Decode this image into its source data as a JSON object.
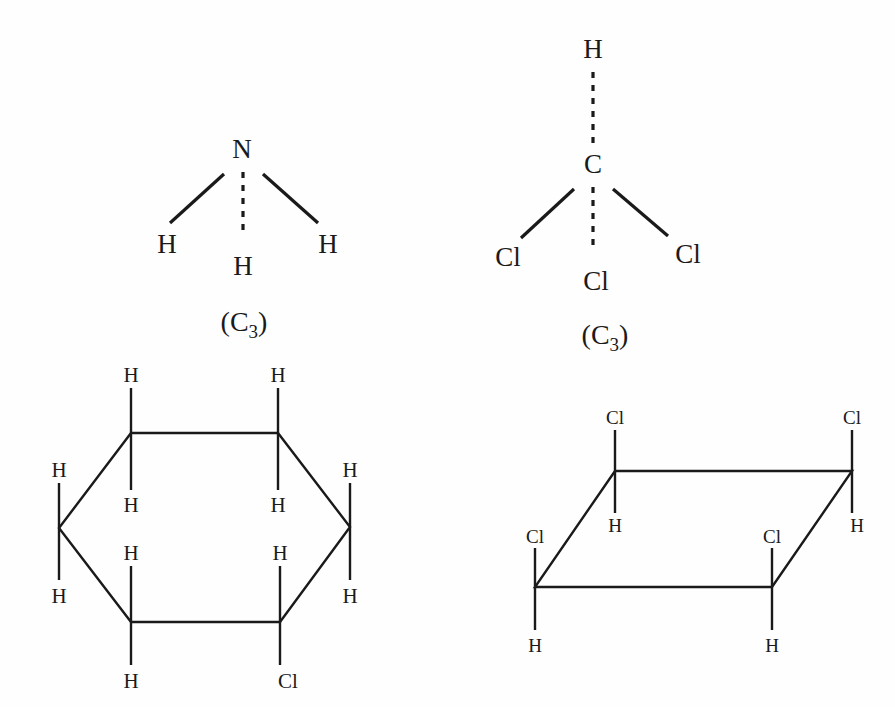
{
  "page": {
    "background_color": "#fefefe",
    "ink_color": "#1a1a1a"
  },
  "figures": [
    {
      "id": "ammonia",
      "name": "ammonia-pyramidal",
      "symmetry_label": "(C",
      "symmetry_subscript": "3",
      "symmetry_label_close": ")",
      "central_atom": "N",
      "substituents": [
        "H",
        "H",
        "H"
      ],
      "labels": {
        "center": "N",
        "left": "H",
        "middle": "H",
        "right": "H"
      }
    },
    {
      "id": "chloroform",
      "name": "chloroform-pyramidal",
      "symmetry_label": "(C",
      "symmetry_subscript": "3",
      "symmetry_label_close": ")",
      "central_atom": "C",
      "substituents": [
        "Cl",
        "Cl",
        "Cl"
      ],
      "labels": {
        "top": "H",
        "center": "C",
        "left": "Cl",
        "middle": "Cl",
        "right": "Cl"
      }
    },
    {
      "id": "chlorocyclohexane",
      "name": "chlorocyclohexane-ring",
      "ring_type": "hexagon",
      "vertex_labels": [
        {
          "position": "top-left-up",
          "text": "H"
        },
        {
          "position": "top-left-down",
          "text": "H"
        },
        {
          "position": "top-right-up",
          "text": "H"
        },
        {
          "position": "top-right-down",
          "text": "H"
        },
        {
          "position": "left-up",
          "text": "H"
        },
        {
          "position": "left-down",
          "text": "H"
        },
        {
          "position": "right-up",
          "text": "H"
        },
        {
          "position": "right-down",
          "text": "H"
        },
        {
          "position": "bottom-left-up",
          "text": "H"
        },
        {
          "position": "bottom-left-down",
          "text": "H"
        },
        {
          "position": "bottom-right-up",
          "text": "H"
        },
        {
          "position": "bottom-right-down",
          "text": "Cl"
        }
      ]
    },
    {
      "id": "tetrachloro-parallelogram",
      "name": "tetrachloro-ring",
      "ring_type": "parallelogram",
      "vertex_labels": [
        {
          "position": "top-left-up",
          "text": "Cl"
        },
        {
          "position": "top-left-down",
          "text": "H"
        },
        {
          "position": "top-right-up",
          "text": "Cl"
        },
        {
          "position": "top-right-down",
          "text": "H"
        },
        {
          "position": "bottom-left-up",
          "text": "Cl"
        },
        {
          "position": "bottom-left-down",
          "text": "H"
        },
        {
          "position": "bottom-right-up",
          "text": "Cl"
        },
        {
          "position": "bottom-right-down",
          "text": "H"
        }
      ]
    }
  ]
}
